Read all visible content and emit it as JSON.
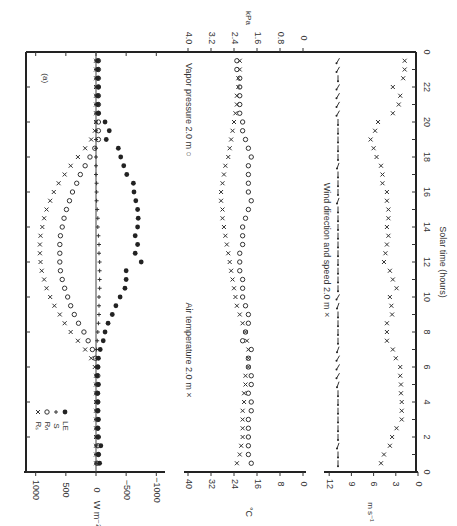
{
  "chart_data": {
    "type": "scatter",
    "orientation": "figure rotated 90 degrees; time axis runs vertically along right edge",
    "xlabel": "Solar time (hours)",
    "x_ticks": [
      0,
      2,
      4,
      6,
      8,
      10,
      12,
      14,
      16,
      18,
      20,
      22,
      24
    ],
    "x_tick_labels": [
      "0",
      "2",
      "4",
      "6",
      "8",
      "10",
      "12",
      "14",
      "16",
      "18",
      "20",
      "22",
      "0"
    ],
    "panels": [
      {
        "id": "energy",
        "panel_label": "(a)",
        "ylabel": "W m⁻²",
        "y_ticks": [
          1000,
          500,
          0,
          -500,
          -1000
        ],
        "y_tick_labels": [
          "1000",
          "500",
          "0",
          "−500",
          "−1000"
        ],
        "ylim": [
          -1100,
          1100
        ],
        "legend": [
          {
            "label": "Rₛ",
            "marker": "×"
          },
          {
            "label": "Rₙ",
            "marker": "○"
          },
          {
            "label": "S",
            "marker": "+"
          },
          {
            "label": "LE",
            "marker": "●"
          }
        ],
        "x": [
          0.5,
          1,
          1.5,
          2,
          2.5,
          3,
          3.5,
          4,
          4.5,
          5,
          5.5,
          6,
          6.5,
          7,
          7.5,
          8,
          8.5,
          9,
          9.5,
          10,
          10.5,
          11,
          11.5,
          12,
          12.5,
          13,
          13.5,
          14,
          14.5,
          15,
          15.5,
          16,
          16.5,
          17,
          17.5,
          18,
          18.5,
          19,
          19.5,
          20,
          20.5,
          21,
          21.5,
          22,
          22.5,
          23,
          23.5
        ],
        "series": [
          {
            "name": "Rs",
            "marker": "x",
            "values": [
              0,
              0,
              0,
              0,
              0,
              0,
              0,
              0,
              0,
              0,
              0,
              20,
              80,
              180,
              300,
              420,
              520,
              600,
              690,
              760,
              820,
              860,
              900,
              920,
              930,
              930,
              920,
              890,
              860,
              820,
              760,
              700,
              620,
              520,
              420,
              300,
              180,
              80,
              20,
              0,
              0,
              0,
              0,
              0,
              0,
              0,
              0
            ]
          },
          {
            "name": "Rn",
            "marker": "o",
            "values": [
              -20,
              -40,
              -30,
              -40,
              -30,
              -30,
              -30,
              -30,
              -20,
              -30,
              -30,
              -30,
              10,
              60,
              130,
              200,
              290,
              360,
              420,
              470,
              520,
              560,
              590,
              600,
              600,
              600,
              590,
              560,
              530,
              490,
              440,
              390,
              320,
              260,
              180,
              100,
              20,
              -40,
              -40,
              -40,
              -40,
              -40,
              -40,
              -40,
              -40,
              -40,
              -40
            ]
          },
          {
            "name": "S",
            "marker": "+",
            "values": [
              0,
              0,
              0,
              0,
              0,
              0,
              0,
              0,
              0,
              0,
              0,
              0,
              -10,
              -10,
              -20,
              -30,
              -40,
              -50,
              -50,
              -50,
              -60,
              -60,
              -60,
              -60,
              -50,
              -50,
              -40,
              -30,
              -30,
              -20,
              -10,
              -10,
              -10,
              0,
              0,
              0,
              0,
              0,
              0,
              0,
              0,
              0,
              0,
              0,
              0,
              0,
              0
            ]
          },
          {
            "name": "LE",
            "marker": "filled",
            "values": [
              -60,
              -40,
              -80,
              -30,
              -30,
              -40,
              -30,
              -30,
              -30,
              -40,
              -20,
              -30,
              -40,
              -70,
              -120,
              -150,
              -200,
              -270,
              -330,
              -400,
              -480,
              -500,
              -500,
              -750,
              -650,
              -690,
              -650,
              -690,
              -700,
              -690,
              -660,
              -630,
              -620,
              -510,
              -460,
              -410,
              -370,
              -170,
              -220,
              -150,
              -40,
              -30,
              -30,
              -40,
              -30,
              -30,
              -30
            ]
          }
        ]
      },
      {
        "id": "air",
        "ylabel": "°C",
        "y2label": "kPa",
        "y_ticks": [
          40,
          32,
          24,
          16,
          8,
          0
        ],
        "y2_ticks": [
          4.0,
          3.2,
          2.4,
          1.6,
          0.8,
          0
        ],
        "ylim": [
          0,
          40
        ],
        "y2lim": [
          0,
          4.0
        ],
        "series_labels": [
          "Air temperature 2.0 m ×",
          "Vapor pressure 2.0 m ○"
        ],
        "x": [
          0.5,
          1,
          1.5,
          2,
          2.5,
          3,
          3.5,
          4,
          4.5,
          5,
          5.5,
          6,
          6.5,
          7,
          7.5,
          8,
          8.5,
          9,
          9.5,
          10,
          10.5,
          11,
          11.5,
          12,
          12.5,
          13,
          13.5,
          14,
          14.5,
          15,
          15.5,
          16,
          16.5,
          17,
          17.5,
          18,
          18.5,
          19,
          19.5,
          20,
          20.5,
          21,
          21.5,
          22,
          22.5,
          23,
          23.5
        ],
        "series": [
          {
            "name": "Air temperature",
            "unit": "°C",
            "marker": "x",
            "values": [
              23,
              22,
              21.5,
              21,
              21,
              21,
              21,
              20.5,
              20.5,
              20,
              20,
              19,
              19,
              19,
              19.5,
              20,
              21,
              22,
              23,
              23.5,
              24,
              24.5,
              25,
              25.5,
              26,
              26.5,
              27,
              27.5,
              28,
              28,
              28.5,
              28.5,
              28,
              27.5,
              27,
              26,
              25.5,
              25,
              24.5,
              24,
              23.5,
              23,
              23,
              22.5,
              22.5,
              22,
              22
            ]
          },
          {
            "name": "Vapor pressure",
            "unit": "kPa",
            "marker": "o",
            "values": [
              1.8,
              1.9,
              1.9,
              1.9,
              1.9,
              1.9,
              1.8,
              1.8,
              1.9,
              1.8,
              1.8,
              1.9,
              1.9,
              1.8,
              2.1,
              2.0,
              1.9,
              1.9,
              2.0,
              2.1,
              2.1,
              2.1,
              2.2,
              2.2,
              2.2,
              2.1,
              2.1,
              2.1,
              2.0,
              1.9,
              1.8,
              1.9,
              1.9,
              1.9,
              1.9,
              1.8,
              1.9,
              2.0,
              2.1,
              2.1,
              2.2,
              2.2,
              2.2,
              2.2,
              2.2,
              2.3,
              2.3
            ]
          }
        ]
      },
      {
        "id": "wind",
        "ylabel": "m s⁻¹",
        "y_ticks": [
          12,
          9,
          6,
          3,
          0
        ],
        "ylim": [
          0,
          12
        ],
        "series_labels": [
          "Wind direction and speed 2.0 m ×"
        ],
        "x": [
          0.5,
          1,
          1.5,
          2,
          2.5,
          3,
          3.5,
          4,
          4.5,
          5,
          5.5,
          6,
          6.5,
          7,
          7.5,
          8,
          8.5,
          9,
          9.5,
          10,
          10.5,
          11,
          11.5,
          12,
          12.5,
          13,
          13.5,
          14,
          14.5,
          15,
          15.5,
          16,
          16.5,
          17,
          17.5,
          18,
          18.5,
          19,
          19.5,
          20,
          20.5,
          21,
          21.5,
          22,
          22.5,
          23,
          23.5
        ],
        "series": [
          {
            "name": "Wind speed",
            "unit": "m s⁻¹",
            "marker": "x",
            "values": [
              5,
              4.6,
              3.8,
              3.5,
              2.9,
              2.2,
              2.2,
              2.2,
              2.3,
              2.3,
              2.4,
              2.4,
              3.0,
              3.4,
              4.2,
              4.2,
              4.2,
              3.5,
              3.6,
              3.8,
              2.9,
              3.4,
              3.8,
              4.6,
              4.4,
              4.2,
              4.0,
              4.2,
              4.0,
              4.0,
              4.2,
              4.2,
              4.8,
              4.8,
              5.0,
              5.6,
              6.0,
              6.4,
              5.8,
              5.4,
              3.4,
              2.6,
              2.4,
              3.4,
              2.0,
              1.8,
              1.8
            ]
          },
          {
            "name": "Wind direction",
            "marker": "arrow",
            "values_deg": [
              180,
              180,
              200,
              180,
              180,
              180,
              180,
              180,
              180,
              200,
              210,
              210,
              210,
              200,
              180,
              180,
              180,
              180,
              200,
              210,
              180,
              180,
              180,
              180,
              180,
              180,
              180,
              180,
              180,
              180,
              200,
              180,
              180,
              180,
              200,
              180,
              180,
              180,
              180,
              180,
              210,
              210,
              210,
              210,
              180,
              210,
              210
            ]
          }
        ]
      }
    ]
  }
}
